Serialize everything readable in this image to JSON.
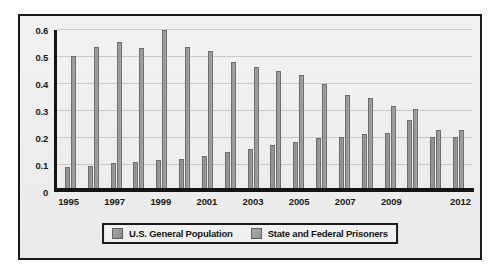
{
  "chart_data": {
    "type": "bar",
    "title": "",
    "xlabel": "",
    "ylabel": "",
    "ylim": [
      0,
      0.6
    ],
    "ytick_values": [
      0,
      0.1,
      0.2,
      0.3,
      0.4,
      0.5,
      0.6
    ],
    "ytick_labels": [
      "0",
      "0.1",
      "0.2",
      "0.3",
      "0.4",
      "0.5",
      "0.6"
    ],
    "grid": true,
    "legend_position": "bottom",
    "categories": [
      "1995",
      "1996",
      "1997",
      "1998",
      "1999",
      "2000",
      "2001",
      "2002",
      "2003",
      "2004",
      "2005",
      "2006",
      "2007",
      "2008",
      "2009",
      "2010",
      "2011",
      "2012"
    ],
    "visible_xtick_labels": [
      "1995",
      "1997",
      "1999",
      "2001",
      "2003",
      "2005",
      "2007",
      "2009",
      "2012"
    ],
    "visible_xtick_categories": [
      "1995",
      "1997",
      "1999",
      "2001",
      "2003",
      "2005",
      "2007",
      "2009",
      "2012"
    ],
    "series": [
      {
        "name": "U.S. General Population",
        "color": "#949494",
        "values": [
          0.08,
          0.085,
          0.095,
          0.1,
          0.105,
          0.11,
          0.12,
          0.135,
          0.15,
          0.165,
          0.175,
          0.19,
          0.195,
          0.205,
          0.21,
          0.26,
          0.195,
          0.195
        ]
      },
      {
        "name": "State and Federal Prisoners",
        "color": "#9c9c9c",
        "values": [
          0.5,
          0.535,
          0.555,
          0.53,
          0.6,
          0.535,
          0.52,
          0.48,
          0.46,
          0.445,
          0.43,
          0.395,
          0.355,
          0.34,
          0.31,
          0.3,
          0.22,
          0.22
        ]
      }
    ]
  },
  "legend": {
    "items": [
      {
        "label": "U.S. General Population",
        "swatch": "series-0-swatch"
      },
      {
        "label": "State and Federal Prisoners",
        "swatch": "series-1-swatch"
      }
    ]
  }
}
